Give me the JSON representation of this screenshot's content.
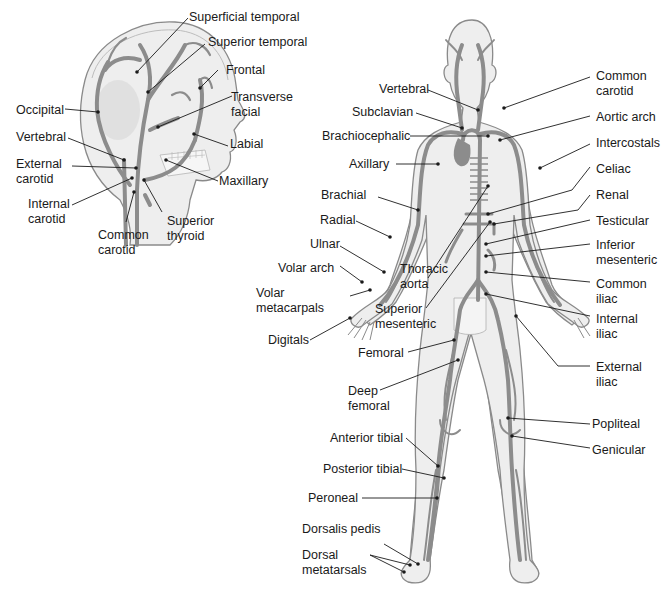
{
  "diagram": {
    "colors": {
      "skin": "#eeeeee",
      "skin_shade": "#dcdcdc",
      "outline": "#8a8a8a",
      "vessel": "#8c8c8c",
      "vessel_dark": "#6e6e6e",
      "leader": "#1a1a1a"
    },
    "head_panel": {
      "labels": {
        "superficial_temporal": "Superficial temporal",
        "superior_temporal": "Superior temporal",
        "frontal": "Frontal",
        "transverse_facial_1": "Transverse",
        "transverse_facial_2": "facial",
        "occipital": "Occipital",
        "labial": "Labial",
        "vertebral": "Vertebral",
        "external_carotid_1": "External",
        "external_carotid_2": "carotid",
        "maxillary": "Maxillary",
        "internal_carotid_1": "Internal",
        "internal_carotid_2": "carotid",
        "superior_thyroid_1": "Superior",
        "superior_thyroid_2": "thyroid",
        "common_carotid_1": "Common",
        "common_carotid_2": "carotid"
      }
    },
    "body_panel": {
      "left_labels": {
        "vertebral": "Vertebral",
        "subclavian": "Subclavian",
        "brachiocephalic": "Brachiocephalic",
        "axillary": "Axillary",
        "brachial": "Brachial",
        "radial": "Radial",
        "ulnar": "Ulnar",
        "volar_arch": "Volar arch",
        "volar_metacarpals_1": "Volar",
        "volar_metacarpals_2": "metacarpals",
        "digitals": "Digitals",
        "thoracic_aorta_1": "Thoracic",
        "thoracic_aorta_2": "aorta",
        "superior_mesenteric_1": "Superior",
        "superior_mesenteric_2": "mesenteric",
        "femoral": "Femoral",
        "deep_femoral_1": "Deep",
        "deep_femoral_2": "femoral",
        "anterior_tibial": "Anterior tibial",
        "posterior_tibial": "Posterior tibial",
        "peroneal": "Peroneal",
        "dorsalis_pedis": "Dorsalis pedis",
        "dorsal_metatarsals_1": "Dorsal",
        "dorsal_metatarsals_2": "metatarsals"
      },
      "right_labels": {
        "common_carotid_1": "Common",
        "common_carotid_2": "carotid",
        "aortic_arch": "Aortic arch",
        "intercostals": "Intercostals",
        "celiac": "Celiac",
        "renal": "Renal",
        "testicular": "Testicular",
        "inferior_mesenteric_1": "Inferior",
        "inferior_mesenteric_2": "mesenteric",
        "common_iliac_1": "Common",
        "common_iliac_2": "iliac",
        "internal_iliac_1": "Internal",
        "internal_iliac_2": "iliac",
        "external_iliac_1": "External",
        "external_iliac_2": "iliac",
        "popliteal": "Popliteal",
        "genicular": "Genicular"
      }
    }
  }
}
